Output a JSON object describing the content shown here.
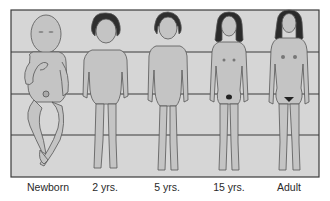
{
  "diagram": {
    "frame": {
      "x": 11,
      "y": 10,
      "width": 308,
      "height": 167
    },
    "guide_lines_y": [
      52,
      94,
      135
    ],
    "colors": {
      "background": "#ffffff",
      "panel": "#d6d6d6",
      "panel_border": "#3a3a3a",
      "skin": "#bdbdbd",
      "skin_outline": "#4a4a4a",
      "hair": "#2b2b2b",
      "label_text": "#2a2a2a"
    },
    "figures": [
      {
        "id": "newborn",
        "label": "Newborn",
        "center_x": 48
      },
      {
        "id": "two-years",
        "label": "2 yrs.",
        "center_x": 105
      },
      {
        "id": "five-years",
        "label": "5 yrs.",
        "center_x": 167
      },
      {
        "id": "fifteen-years",
        "label": "15 yrs.",
        "center_x": 229
      },
      {
        "id": "adult",
        "label": "Adult",
        "center_x": 289
      }
    ]
  }
}
